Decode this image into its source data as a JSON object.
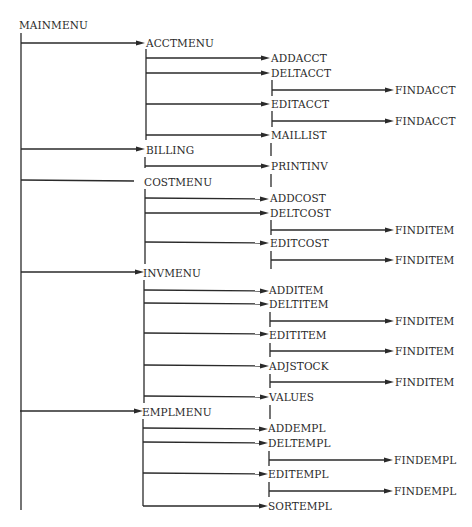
{
  "diagram": {
    "type": "menu-hierarchy",
    "root": "MAINMENU",
    "nodes": {
      "mainmenu": "MAINMENU",
      "acctmenu": "ACCTMENU",
      "addacct": "ADDACCT",
      "deltacct": "DELTACCT",
      "deltacct_find": "FINDACCT",
      "editacct": "EDITACCT",
      "editacct_find": "FINDACCT",
      "maillist": "MAILLIST",
      "billing": "BILLING",
      "printinv": "PRINTINV",
      "costmenu": "COSTMENU",
      "addcost": "ADDCOST",
      "deltcost": "DELTCOST",
      "deltcost_find": "FINDITEM",
      "editcost": "EDITCOST",
      "editcost_find": "FINDITEM",
      "invmenu": "INVMENU",
      "additem": "ADDITEM",
      "deltitem": "DELTITEM",
      "deltitem_find": "FINDITEM",
      "edititem": "EDITITEM",
      "edititem_find": "FINDITEM",
      "adjstock": "ADJSTOCK",
      "adjstock_find": "FINDITEM",
      "values": "VALUES",
      "emplmenu": "EMPLMENU",
      "addempl": "ADDEMPL",
      "deltempl": "DELTEMPL",
      "deltempl_find": "FINDEMPL",
      "editempl": "EDITEMPL",
      "editempl_find": "FINDEMPL",
      "sortempl": "SORTEMPL"
    },
    "tree": {
      "MAINMENU": [
        "ACCTMENU",
        "BILLING",
        "COSTMENU",
        "INVMENU",
        "EMPLMENU"
      ],
      "ACCTMENU": [
        "ADDACCT",
        "DELTACCT",
        "EDITACCT",
        "MAILLIST"
      ],
      "DELTACCT": [
        "FINDACCT"
      ],
      "EDITACCT": [
        "FINDACCT"
      ],
      "BILLING": [
        "PRINTINV"
      ],
      "COSTMENU": [
        "ADDCOST",
        "DELTCOST",
        "EDITCOST"
      ],
      "DELTCOST": [
        "FINDITEM"
      ],
      "EDITCOST": [
        "FINDITEM"
      ],
      "INVMENU": [
        "ADDITEM",
        "DELTITEM",
        "EDITITEM",
        "ADJSTOCK",
        "VALUES"
      ],
      "DELTITEM": [
        "FINDITEM"
      ],
      "EDITITEM": [
        "FINDITEM"
      ],
      "ADJSTOCK": [
        "FINDITEM"
      ],
      "EMPLMENU": [
        "ADDEMPL",
        "DELTEMPL",
        "EDITEMPL",
        "SORTEMPL"
      ],
      "DELTEMPL": [
        "FINDEMPL"
      ],
      "EDITEMPL": [
        "FINDEMPL"
      ]
    },
    "colors": {
      "line": "#2a2a2a",
      "text": "#2a2a2a",
      "background": "#ffffff"
    }
  }
}
